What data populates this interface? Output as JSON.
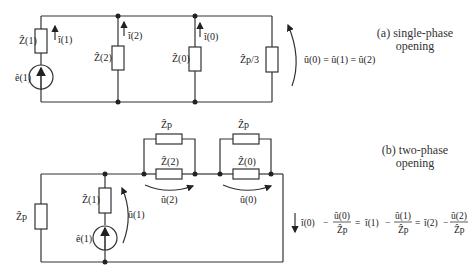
{
  "diagram_a": {
    "caption_line1": "(a) single-phase",
    "caption_line2": "opening",
    "labels": {
      "z1": "Ẑ(1)",
      "z2": "Ẑ(2)",
      "z0": "Ẑ(0)",
      "zp3": "Ẑp/3",
      "e1": "ê(1)",
      "i1": "î(1)",
      "i2": "î(2)",
      "i0": "î(0)"
    },
    "equation": "û(0) = û(1) = û(2)"
  },
  "diagram_b": {
    "caption_line1": "(b) two-phase",
    "caption_line2": "opening",
    "labels": {
      "zp_left": "Ẑp",
      "z1": "Ẑ(1)",
      "e1": "ê(1)",
      "u1": "û(1)",
      "zp_top1": "Ẑp",
      "z2": "Ẑ(2)",
      "u2": "û(2)",
      "zp_top2": "Ẑp",
      "z0": "Ẑ(0)",
      "u0": "û(0)"
    },
    "equation": {
      "t1_i": "î(0)",
      "t1_num": "û(0)",
      "t1_den": "Ẑp",
      "t2_i": "î(1)",
      "t2_num": "û(1)",
      "t2_den": "Ẑp",
      "t3_i": "î(2)",
      "t3_num": "û(2)",
      "t3_den": "Ẑp",
      "minus": "−",
      "equals": "="
    }
  }
}
